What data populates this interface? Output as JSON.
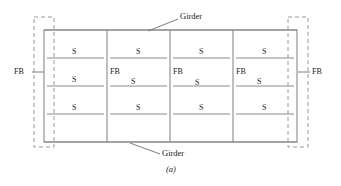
{
  "figure": {
    "caption": "(a)"
  },
  "labels": {
    "girder_top": "Girder",
    "girder_bottom": "Girder",
    "floor_beam_left": "FB",
    "floor_beam_right": "FB",
    "stringer": "S",
    "floor_beam": "FB"
  },
  "legend": {
    "S": "Stringer",
    "FB": "Floor Beam"
  },
  "structure": {
    "bay_count": 4,
    "stringer_rows": 3,
    "interior_floor_beams": 3,
    "end_floor_beams": 2
  },
  "bays": [
    {
      "index": 0,
      "stringers": [
        "S",
        "S",
        "S"
      ],
      "floor_beam_label": null
    },
    {
      "index": 1,
      "stringers": [
        "S",
        "S",
        "S"
      ],
      "floor_beam_label": "FB"
    },
    {
      "index": 2,
      "stringers": [
        "S",
        "S",
        "S"
      ],
      "floor_beam_label": "FB"
    },
    {
      "index": 3,
      "stringers": [
        "S",
        "S",
        "S"
      ],
      "floor_beam_label": "FB"
    }
  ],
  "colors": {
    "line": "#8a8a8a",
    "line_dark": "#7a7a7a",
    "dashed": "#9a9a9a",
    "text": "#1a1a1a",
    "background": "#ffffff"
  }
}
